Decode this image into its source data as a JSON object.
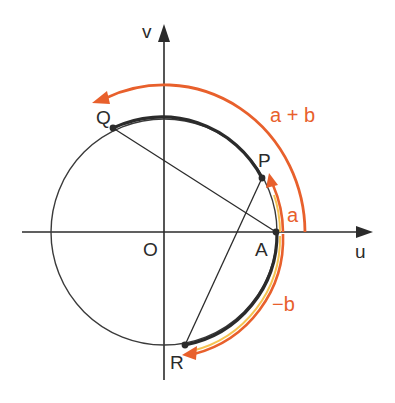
{
  "diagram": {
    "title": "",
    "axes": {
      "horizontal_label": "u",
      "vertical_label": "v",
      "origin_label": "O"
    },
    "points": [
      {
        "id": "A",
        "label": "A",
        "description": "intersection of circle with positive u-axis"
      },
      {
        "id": "P",
        "label": "P",
        "description": "point on circle at arc length a from A"
      },
      {
        "id": "Q",
        "label": "Q",
        "description": "point on circle at arc length a + b from A"
      },
      {
        "id": "R",
        "label": "R",
        "description": "point on circle at arc length -b from A"
      }
    ],
    "arcs": [
      {
        "label": "a",
        "from": "A",
        "to": "P",
        "direction": "counterclockwise",
        "color": "#e8602c"
      },
      {
        "label": "a + b",
        "from": "A",
        "to": "Q",
        "direction": "counterclockwise",
        "color": "#e8602c"
      },
      {
        "label": "−b",
        "from": "A",
        "to": "R",
        "direction": "clockwise",
        "color": "#e8602c"
      }
    ],
    "segments": [
      {
        "from": "Q",
        "to": "A"
      },
      {
        "from": "R",
        "to": "P"
      }
    ],
    "colors": {
      "ink": "#2b2b2b",
      "accent": "#e8602c",
      "highlight": "#f6c451"
    }
  },
  "labels": {
    "u": "u",
    "v": "v",
    "O": "O",
    "A": "A",
    "P": "P",
    "Q": "Q",
    "R": "R",
    "a": "a",
    "a_plus_b": "a + b",
    "minus_b": "−b"
  }
}
